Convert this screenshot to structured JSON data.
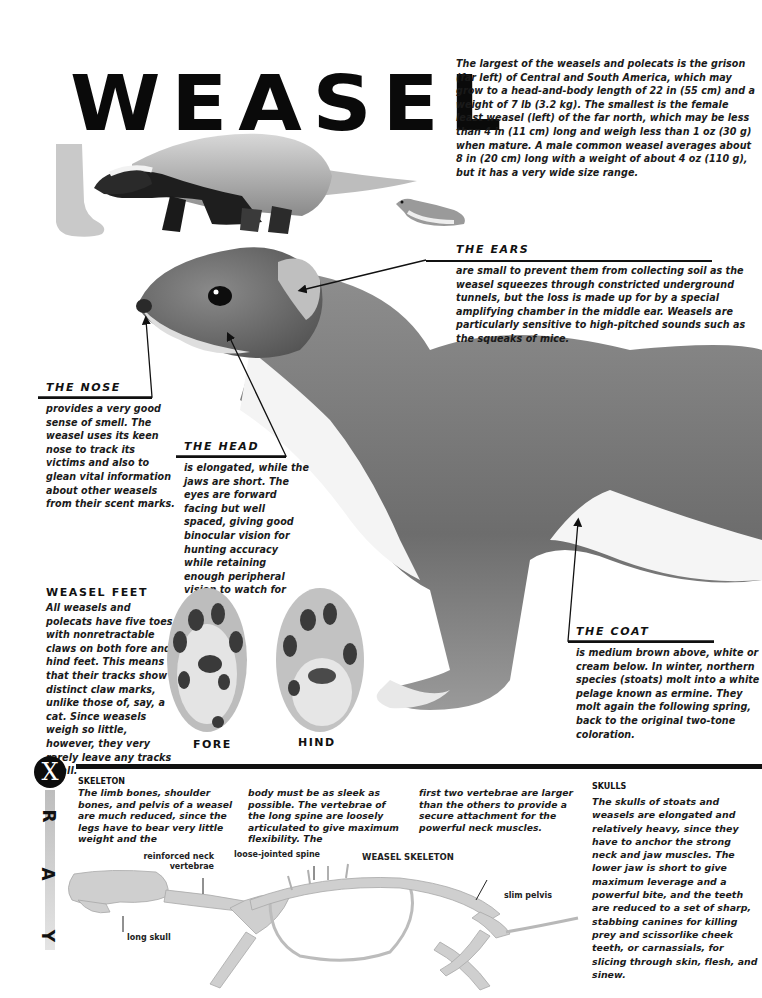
{
  "title": "WEASEL",
  "intro": "The largest of the weasels and polecats is the grison (far left) of Central and South America, which may grow to a head-and-body length of 22 in (55 cm) and a weight of 7 lb (3.2 kg). The smallest is the female least weasel (left) of the far north, which may be less than 4 in (11 cm) long and weigh less than 1 oz (30 g) when mature. A male common weasel averages about 8 in (20 cm) long with a weight of about 4 oz (110 g), but it has a very wide size range.",
  "callouts": {
    "ears": {
      "heading": "THE EARS",
      "text": "are small to prevent them from collecting soil as the weasel squeezes through constricted underground tunnels, but the loss is made up for by a special amplifying chamber in the middle ear. Weasels are particularly sensitive to high-pitched sounds such as the squeaks of mice."
    },
    "nose": {
      "heading": "THE NOSE",
      "text": "provides a very good sense of smell. The weasel uses its keen nose to track its victims and also to glean vital information about other weasels from their scent marks."
    },
    "head": {
      "heading": "THE HEAD",
      "text": "is elongated, while the jaws are short. The eyes are forward facing but well spaced, giving good binocular vision for hunting accuracy while retaining enough peripheral vision to watch for enemies."
    },
    "feet": {
      "heading": "WEASEL FEET",
      "text": "All weasels and polecats have five toes with nonretractable claws on both fore and hind feet. This means that their tracks show distinct claw marks, unlike those of, say, a cat. Since weasels weigh so little, however, they very rarely leave any tracks at all.",
      "fore_label": "FORE",
      "hind_label": "HIND"
    },
    "coat": {
      "heading": "THE COAT",
      "text": "is medium brown above, white or cream below. In winter, northern species (stoats) molt into a white pelage known as ermine. They molt again the following spring, back to the original two-tone coloration."
    }
  },
  "xray": {
    "badge_letter": "X",
    "side_letters": [
      "R",
      "A",
      "Y"
    ],
    "skeleton": {
      "heading": "SKELETON",
      "col1": "The limb bones, shoulder bones, and pelvis of a weasel are much reduced, since the legs have to bear very little weight and the",
      "col2": "body must be as sleek as possible. The vertebrae of the long spine are loosely articulated to give maximum flexibility. The",
      "col3": "first two vertebrae are larger than the others to provide a secure attachment for the powerful neck muscles."
    },
    "skulls": {
      "heading": "SKULLS",
      "text": "The skulls of stoats and weasels are elongated and relatively heavy, since they have to anchor the strong neck and jaw muscles. The lower jaw is short to give maximum leverage and a powerful bite, and the teeth are reduced to a set of sharp, stabbing canines for killing prey and scissorlike cheek teeth, or carnassials, for slicing through skin, flesh, and sinew."
    },
    "diagram": {
      "title": "WEASEL SKELETON",
      "labels": {
        "neck": "reinforced neck vertebrae",
        "spine": "loose-jointed spine",
        "pelvis": "slim pelvis",
        "skull": "long skull"
      }
    }
  }
}
